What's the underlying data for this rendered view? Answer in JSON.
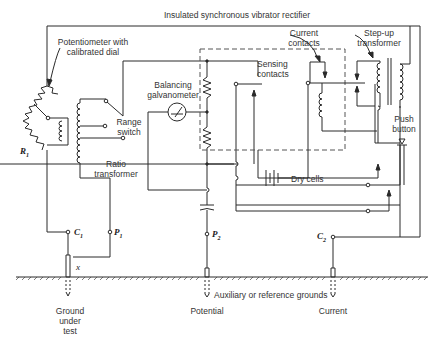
{
  "diagram": {
    "title": "Insulated synchronous vibrator rectifier",
    "components": {
      "potentiometer": {
        "label_line1": "Potentiometer with",
        "label_line2": "calibrated dial",
        "ref": "R",
        "ref_sub": "1"
      },
      "range_switch": {
        "label_line1": "Range",
        "label_line2": "switch"
      },
      "ratio_transformer": {
        "label_line1": "Ratio",
        "label_line2": "transformer"
      },
      "galvanometer": {
        "label_line1": "Balancing",
        "label_line2": "galvanometer"
      },
      "sensing_contacts": {
        "label_line1": "Sensing",
        "label_line2": "contacts"
      },
      "current_contacts": {
        "label_line1": "Current",
        "label_line2": "contacts"
      },
      "step_up_transformer": {
        "label_line1": "Step-up",
        "label_line2": "transformer"
      },
      "push_button": {
        "label_line1": "Push",
        "label_line2": "button"
      },
      "dry_cells": {
        "label": "Dry cells"
      }
    },
    "terminals": {
      "c1": {
        "name": "C",
        "sub": "1"
      },
      "p1": {
        "name": "P",
        "sub": "1"
      },
      "p2": {
        "name": "P",
        "sub": "2"
      },
      "c2": {
        "name": "C",
        "sub": "2"
      },
      "x": "x"
    },
    "grounds": {
      "ground_under_test": {
        "line1": "Ground",
        "line2": "under",
        "line3": "test"
      },
      "potential": "Potential",
      "current": "Current",
      "auxiliary": "Auxiliary or reference grounds"
    },
    "colors": {
      "line": "#2a2a2a",
      "text": "#333333",
      "background": "#ffffff",
      "dashed": "#555555"
    }
  }
}
